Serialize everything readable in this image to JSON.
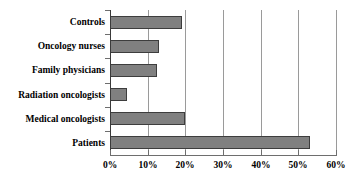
{
  "chart_data": {
    "type": "bar",
    "orientation": "horizontal",
    "title": "",
    "xlabel": "",
    "ylabel": "",
    "categories": [
      "Patients",
      "Medical oncologists",
      "Radiation oncologists",
      "Family physicians",
      "Oncology nurses",
      "Controls"
    ],
    "values": [
      53,
      20,
      4.5,
      12.5,
      13,
      19
    ],
    "series": [
      {
        "name": "Percent",
        "values": [
          53,
          20,
          4.5,
          12.5,
          13,
          19
        ]
      }
    ],
    "xlim": [
      0,
      60
    ],
    "xticks": [
      0,
      10,
      20,
      30,
      40,
      50,
      60
    ],
    "xtick_labels": [
      "0%",
      "10%",
      "20%",
      "30%",
      "40%",
      "50%",
      "60%"
    ],
    "grid": true,
    "grid_axis": "x",
    "legend": false,
    "bar_color": "#808080",
    "bar_border_color": "#3d3d3d",
    "gridline_color": "#9a9a9a",
    "axis_color": "#6e6e6e",
    "text_color": "#000000",
    "background": "#ffffff"
  }
}
